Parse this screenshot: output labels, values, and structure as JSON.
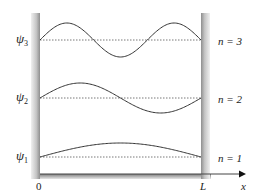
{
  "figure": {
    "type": "particle-in-a-box wavefunctions",
    "left_wall_label": "0",
    "right_wall_label": "L",
    "axis_label": "x",
    "colors": {
      "wall_dark": "#9a9a9a",
      "wall_light": "#f2f2f2",
      "curve": "#333333",
      "baseline": "#555555",
      "text": "#222222"
    },
    "states": [
      {
        "psi_symbol": "ψ",
        "psi_index": "3",
        "n_label": "n = 3",
        "nodes": 2,
        "baseline_y": 40,
        "amplitude": 17
      },
      {
        "psi_symbol": "ψ",
        "psi_index": "2",
        "n_label": "n = 2",
        "nodes": 1,
        "baseline_y": 98,
        "amplitude": 15
      },
      {
        "psi_symbol": "ψ",
        "psi_index": "1",
        "n_label": "n = 1",
        "nodes": 0,
        "baseline_y": 157,
        "amplitude": 14
      }
    ]
  }
}
